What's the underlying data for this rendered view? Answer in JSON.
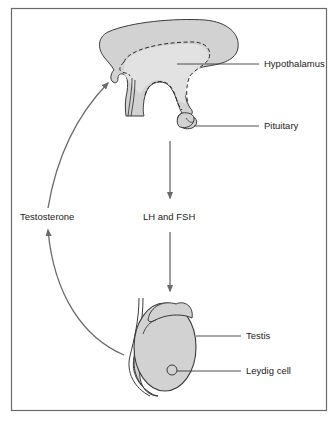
{
  "diagram": {
    "type": "feedback-loop",
    "labels": {
      "hypothalamus": "Hypothalamus",
      "pituitary": "Pituitary",
      "lh_fsh": "LH and FSH",
      "testosterone": "Testosterone",
      "testis": "Testis",
      "leydig_cell": "Leydig cell"
    },
    "colors": {
      "border": "#6a6a6a",
      "fill": "#d2d2d2",
      "fill_light": "#e2e2e2",
      "stroke": "#3a3a3a",
      "arrow": "#6a6a6a",
      "text": "#222222"
    },
    "flows": [
      {
        "from": "Pituitary",
        "to": "Testis",
        "label": "LH and FSH",
        "direction": "down"
      },
      {
        "from": "Testis",
        "to": "Hypothalamus",
        "label": "Testosterone",
        "direction": "up-curved"
      }
    ]
  }
}
